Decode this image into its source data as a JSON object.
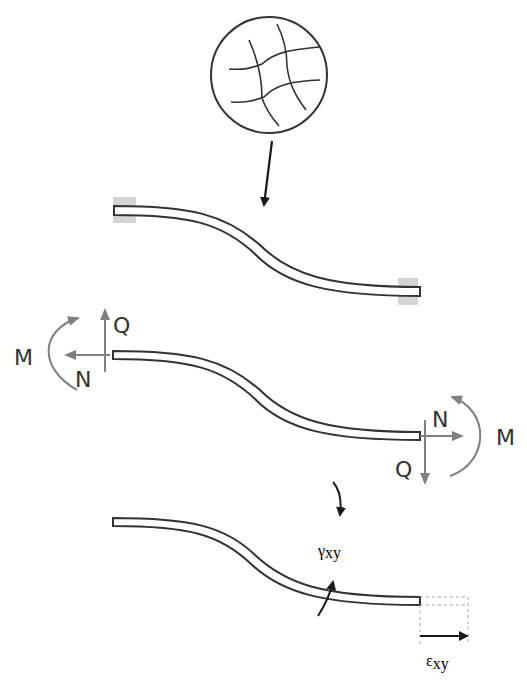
{
  "diagram": {
    "colors": {
      "ink": "#222222",
      "force_arrow": "#808080",
      "clamp_fill": "#d4d4d4",
      "dashed": "#aaaaaa",
      "label": "#333333"
    },
    "panels": {
      "detail": {
        "name": "microstructure-detail"
      },
      "clamped": {
        "name": "clamped-beam"
      },
      "free_body": {
        "name": "free-body-beam",
        "left": {
          "moment": "M",
          "normal": "N",
          "shear": "Q"
        },
        "right": {
          "moment": "M",
          "normal": "N",
          "shear": "Q"
        }
      },
      "strain": {
        "name": "strain-beam",
        "shear_strain": {
          "symbol": "γ",
          "subscript": "xy"
        },
        "normal_strain": {
          "symbol": "ε",
          "subscript": "xy"
        }
      }
    }
  }
}
